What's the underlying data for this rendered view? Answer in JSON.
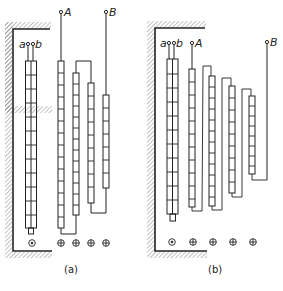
{
  "colors": {
    "ink": "#222222",
    "hatch": "#555555",
    "background": "#ffffff"
  },
  "panels": [
    {
      "id": "a",
      "caption": "(a)",
      "terminals": {
        "a": "a",
        "b": "b",
        "A": "A",
        "B": "B"
      },
      "coil_count": 4,
      "slot_markers": [
        "dot-circle",
        "plus-circle",
        "plus-circle",
        "plus-circle",
        "plus-circle"
      ]
    },
    {
      "id": "b",
      "caption": "(b)",
      "terminals": {
        "a": "a",
        "b": "b",
        "A": "A",
        "B": "B"
      },
      "coil_count": 4,
      "slot_markers": [
        "dot-circle",
        "plus-circle",
        "plus-circle",
        "plus-circle",
        "plus-circle"
      ]
    }
  ]
}
